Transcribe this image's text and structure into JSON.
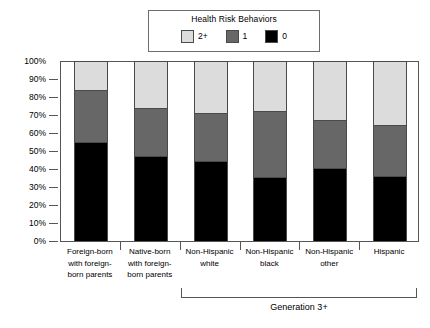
{
  "chart_data": {
    "type": "bar",
    "title": "",
    "xlabel": "",
    "ylabel": "",
    "ylim": [
      0,
      100
    ],
    "grid": false,
    "stacked": true,
    "normalized_percent": true,
    "legend_title": "Health Risk Behaviors",
    "legend_position": "top-center",
    "categories": [
      "Foreign-born\nwith foreign-\nborn parents",
      "Native-born\nwith foreign-\nborn parents",
      "Non-Hispanic\nwhite",
      "Non-Hispanic\nblack",
      "Non-Hispanic\nother",
      "Hispanic"
    ],
    "series": [
      {
        "name": "0",
        "color": "#000000",
        "values": [
          55,
          47,
          44,
          35,
          40,
          36
        ]
      },
      {
        "name": "1",
        "color": "#676767",
        "values": [
          29,
          27,
          27,
          37,
          27,
          28
        ]
      },
      {
        "name": "2+",
        "color": "#dcdcdc",
        "values": [
          16,
          26,
          29,
          28,
          33,
          36
        ]
      }
    ],
    "y_ticks": [
      "0%",
      "10%",
      "20%",
      "30%",
      "40%",
      "50%",
      "60%",
      "70%",
      "80%",
      "90%",
      "100%"
    ],
    "y_tick_values": [
      0,
      10,
      20,
      30,
      40,
      50,
      60,
      70,
      80,
      90,
      100
    ],
    "annotations": [
      {
        "text": "Generation 3+",
        "type": "bracket",
        "spans_categories": [
          "Non-Hispanic white",
          "Non-Hispanic black",
          "Non-Hispanic other",
          "Hispanic"
        ]
      }
    ]
  },
  "legend": {
    "title": "Health Risk Behaviors",
    "entries": [
      {
        "label": "2+",
        "color": "#dcdcdc"
      },
      {
        "label": "1",
        "color": "#676767"
      },
      {
        "label": "0",
        "color": "#000000"
      }
    ]
  },
  "axis": {
    "y_ticks": [
      "100%",
      "90%",
      "80%",
      "70%",
      "60%",
      "50%",
      "40%",
      "30%",
      "20%",
      "10%",
      "0%"
    ]
  },
  "categories": [
    "Foreign-born\nwith foreign-\nborn parents",
    "Native-born\nwith foreign-\nborn parents",
    "Non-Hispanic\nwhite",
    "Non-Hispanic\nblack",
    "Non-Hispanic\nother",
    "Hispanic"
  ],
  "bracket": {
    "label": "Generation 3+"
  }
}
